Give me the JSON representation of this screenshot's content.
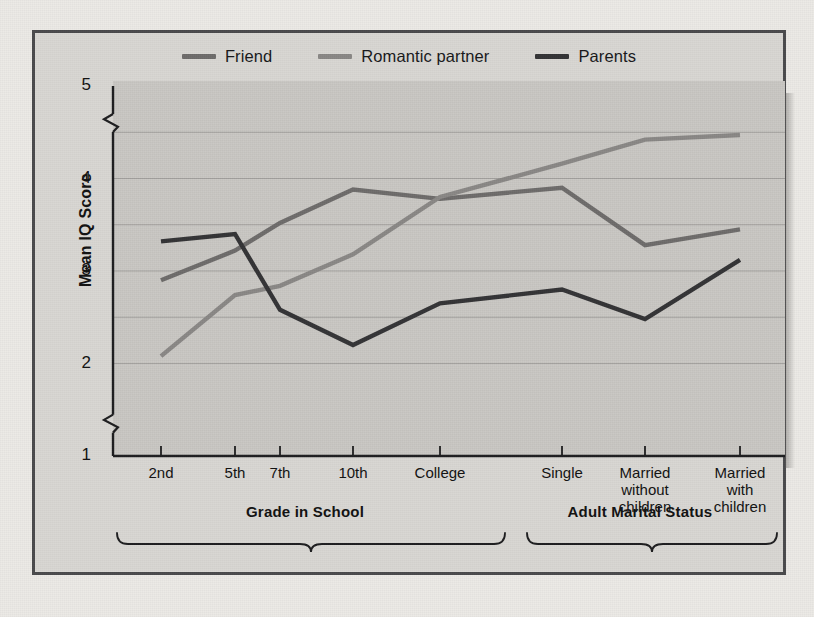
{
  "chart_data": {
    "type": "line",
    "title": "",
    "xlabel": "",
    "ylabel": "Mean IQ Score",
    "ylim": [
      1,
      5
    ],
    "yticks": [
      1,
      2,
      3,
      4,
      5
    ],
    "gridlines": [
      2,
      2.5,
      3,
      3.5,
      4,
      4.5
    ],
    "grid": true,
    "axis_breaks": [
      1.35,
      4.6
    ],
    "legend_position": "top-center",
    "categories": [
      "2nd",
      "5th",
      "7th",
      "10th",
      "College",
      "Single",
      "Married without children",
      "Married with children"
    ],
    "group_labels": [
      "Grade in School",
      "Adult Marital Status"
    ],
    "groups": [
      {
        "label": "Grade in School",
        "categories": [
          "2nd",
          "5th",
          "7th",
          "10th",
          "College"
        ]
      },
      {
        "label": "Adult Marital Status",
        "categories": [
          "Single",
          "Married without children",
          "Married with children"
        ]
      }
    ],
    "series": [
      {
        "name": "Friend",
        "color": "#6e6c6b",
        "values": [
          2.9,
          3.22,
          3.52,
          3.88,
          3.78,
          3.9,
          3.28,
          3.45
        ]
      },
      {
        "name": "Romantic partner",
        "color": "#8a8886",
        "values": [
          2.08,
          2.74,
          2.84,
          3.18,
          3.8,
          4.16,
          4.42,
          4.47
        ]
      },
      {
        "name": "Parents",
        "color": "#343436",
        "values": [
          3.32,
          3.4,
          2.58,
          2.2,
          2.65,
          2.8,
          2.48,
          3.12
        ]
      }
    ]
  },
  "legend": {
    "items": [
      {
        "label": "Friend",
        "color": "#6e6c6b"
      },
      {
        "label": "Romantic partner",
        "color": "#8a8886"
      },
      {
        "label": "Parents",
        "color": "#343436"
      }
    ]
  },
  "axes": {
    "y_title": "Mean IQ Score",
    "y_tick_labels": [
      "5",
      "4",
      "3",
      "2",
      "1"
    ],
    "x_tick_labels": [
      "2nd",
      "5th",
      "7th",
      "10th",
      "College",
      "Single",
      "Married\nwithout\nchildren",
      "Married\nwith\nchildren"
    ]
  },
  "braces": {
    "school": "Grade in School",
    "adult": "Adult Marital Status"
  },
  "colors": {
    "page_background": "#eceae6",
    "panel_background": "#d9d7d3",
    "plot_background": "#c9c7c3",
    "frame_border": "#4a4a4c",
    "grid": "#a3a19e",
    "axis": "#1d1d1f",
    "text": "#111111"
  }
}
